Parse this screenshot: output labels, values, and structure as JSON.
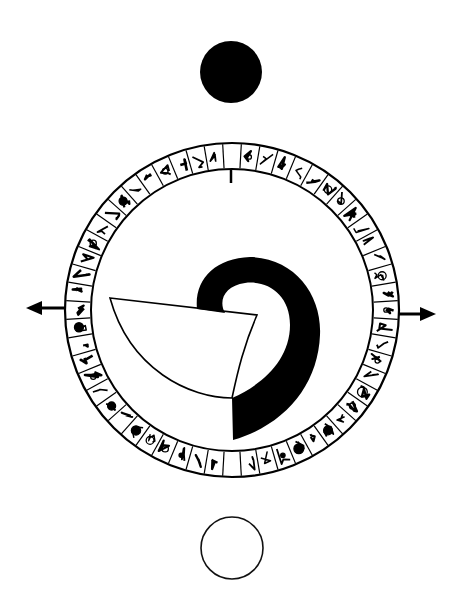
{
  "diagram": {
    "colors": {
      "ink": "#000000",
      "paper": "#ffffff"
    },
    "top_disc": {
      "label": "dark-moon",
      "fill": "#000000"
    },
    "bottom_disc": {
      "label": "full-moon",
      "fill": "#ffffff"
    },
    "arrows": [
      {
        "label": "arrow-left",
        "direction": "left"
      },
      {
        "label": "arrow-right",
        "direction": "right"
      }
    ],
    "ring": {
      "glyph_cell_count": 56,
      "blank_cells": [
        "top",
        "bottom"
      ],
      "marker": "tick below top blank cell"
    },
    "spiral": {
      "label": "spiral-hook"
    }
  }
}
